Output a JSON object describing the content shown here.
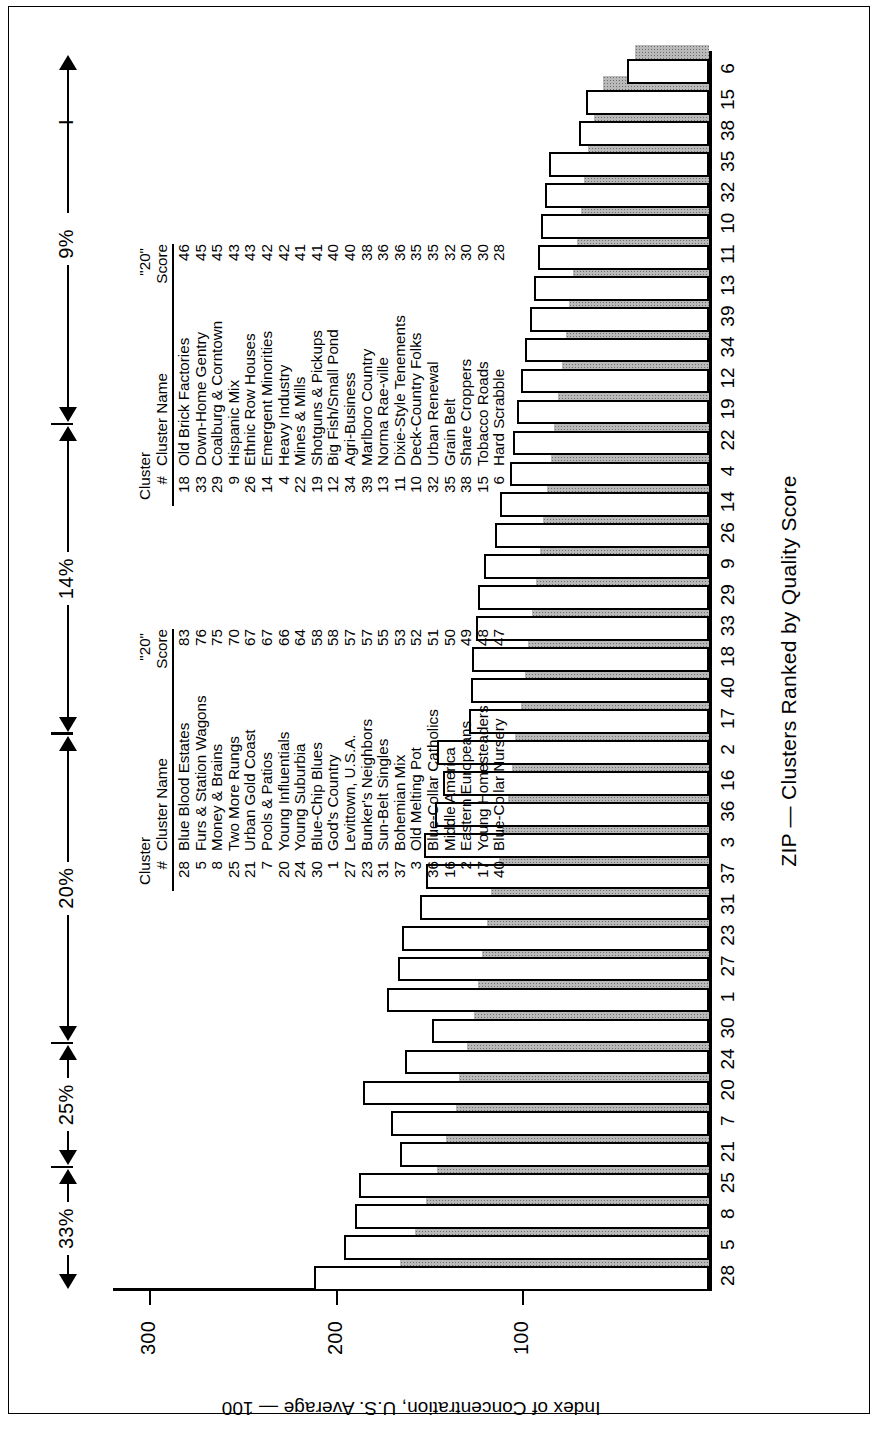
{
  "chart_data": {
    "type": "bar",
    "title": "ZIP — Clusters Ranked by Quality Score",
    "xlabel": "ZIP — Clusters Ranked by Quality Score",
    "ylabel": "Index of Concentration, U.S. Average — 100",
    "ylim": [
      0,
      320
    ],
    "yticks": [
      100,
      200,
      300
    ],
    "grid": false,
    "legend": null,
    "categories": [
      "28",
      "5",
      "8",
      "25",
      "21",
      "7",
      "20",
      "24",
      "30",
      "1",
      "27",
      "23",
      "31",
      "37",
      "3",
      "36",
      "16",
      "2",
      "17",
      "40",
      "18",
      "33",
      "29",
      "9",
      "26",
      "14",
      "4",
      "22",
      "19",
      "12",
      "34",
      "39",
      "13",
      "11",
      "10",
      "32",
      "35",
      "38",
      "15",
      "6"
    ],
    "series": [
      {
        "name": "outline-bar",
        "values": [
          212,
          196,
          190,
          188,
          166,
          171,
          186,
          163,
          149,
          173,
          167,
          165,
          155,
          152,
          153,
          147,
          143,
          146,
          129,
          128,
          127,
          125,
          124,
          121,
          115,
          112,
          107,
          105,
          103,
          101,
          99,
          96,
          94,
          92,
          90,
          88,
          86,
          70,
          66,
          44
        ]
      },
      {
        "name": "shaded-bar",
        "values": [
          166,
          158,
          152,
          146,
          141,
          136,
          134,
          130,
          126,
          124,
          122,
          119,
          117,
          113,
          111,
          108,
          106,
          104,
          101,
          99,
          97,
          95,
          93,
          91,
          89,
          87,
          85,
          83,
          81,
          79,
          77,
          75,
          73,
          71,
          69,
          67,
          65,
          62,
          57,
          40
        ]
      }
    ]
  },
  "y_axis": {
    "label": "Index of Concentration, U.S. Average — 100",
    "ticks": [
      "300",
      "200",
      "100"
    ]
  },
  "x_axis": {
    "title": "ZIP — Clusters Ranked by Quality Score",
    "ticks": [
      "28",
      "5",
      "8",
      "25",
      "21",
      "7",
      "20",
      "24",
      "30",
      "1",
      "27",
      "23",
      "31",
      "37",
      "3",
      "36",
      "16",
      "2",
      "17",
      "40",
      "18",
      "33",
      "29",
      "9",
      "26",
      "14",
      "4",
      "22",
      "19",
      "12",
      "34",
      "39",
      "13",
      "11",
      "10",
      "32",
      "35",
      "38",
      "15",
      "6"
    ]
  },
  "brackets": [
    {
      "label": "33%"
    },
    {
      "label": "25%"
    },
    {
      "label": "20%"
    },
    {
      "label": "14%"
    },
    {
      "label": "9%"
    }
  ],
  "table_left": {
    "group_header": "Cluster",
    "score_header_top": "\"20\"",
    "score_header_bottom": "Score",
    "columns": [
      "#",
      "Cluster Name",
      "Score"
    ],
    "rows": [
      {
        "num": "28",
        "name": "Blue Blood Estates",
        "score": "83"
      },
      {
        "num": "5",
        "name": "Furs & Station Wagons",
        "score": "76"
      },
      {
        "num": "8",
        "name": "Money & Brains",
        "score": "75"
      },
      {
        "num": "25",
        "name": "Two More Rungs",
        "score": "70"
      },
      {
        "num": "21",
        "name": "Urban Gold Coast",
        "score": "67"
      },
      {
        "num": "7",
        "name": "Pools & Patios",
        "score": "67"
      },
      {
        "num": "20",
        "name": "Young Influentials",
        "score": "66"
      },
      {
        "num": "24",
        "name": "Young Suburbia",
        "score": "64"
      },
      {
        "num": "30",
        "name": "Blue-Chip Blues",
        "score": "58"
      },
      {
        "num": "1",
        "name": "God's Country",
        "score": "58"
      },
      {
        "num": "27",
        "name": "Levittown, U.S.A.",
        "score": "57"
      },
      {
        "num": "23",
        "name": "Bunker's Neighbors",
        "score": "57"
      },
      {
        "num": "31",
        "name": "Sun-Belt Singles",
        "score": "55"
      },
      {
        "num": "37",
        "name": "Bohemian Mix",
        "score": "53"
      },
      {
        "num": "3",
        "name": "Old Melting Pot",
        "score": "52"
      },
      {
        "num": "36",
        "name": "Blue-Collar Catholics",
        "score": "51"
      },
      {
        "num": "16",
        "name": "Middle America",
        "score": "50"
      },
      {
        "num": "2",
        "name": "Eastern Europeans",
        "score": "49"
      },
      {
        "num": "17",
        "name": "Young Homesteaders",
        "score": "48"
      },
      {
        "num": "40",
        "name": "Blue-Collar Nursery",
        "score": "47"
      }
    ]
  },
  "table_right": {
    "group_header": "Cluster",
    "score_header_top": "\"20\"",
    "score_header_bottom": "Score",
    "columns": [
      "#",
      "Cluster Name",
      "Score"
    ],
    "rows": [
      {
        "num": "18",
        "name": "Old Brick Factories",
        "score": "46"
      },
      {
        "num": "33",
        "name": "Down-Home Gentry",
        "score": "45"
      },
      {
        "num": "29",
        "name": "Coalburg & Corntown",
        "score": "45"
      },
      {
        "num": "9",
        "name": "Hispanic Mix",
        "score": "43"
      },
      {
        "num": "26",
        "name": "Ethnic Row Houses",
        "score": "43"
      },
      {
        "num": "14",
        "name": "Emergent Minorities",
        "score": "42"
      },
      {
        "num": "4",
        "name": "Heavy Industry",
        "score": "42"
      },
      {
        "num": "22",
        "name": "Mines & Mills",
        "score": "41"
      },
      {
        "num": "19",
        "name": "Shotguns & Pickups",
        "score": "41"
      },
      {
        "num": "12",
        "name": "Big Fish/Small Pond",
        "score": "40"
      },
      {
        "num": "34",
        "name": "Agri-Business",
        "score": "40"
      },
      {
        "num": "39",
        "name": "Marlboro Country",
        "score": "38"
      },
      {
        "num": "13",
        "name": "Norma Rae-ville",
        "score": "36"
      },
      {
        "num": "11",
        "name": "Dixie-Style Tenements",
        "score": "36"
      },
      {
        "num": "10",
        "name": "Deck-Country Folks",
        "score": "35"
      },
      {
        "num": "32",
        "name": "Urban Renewal",
        "score": "35"
      },
      {
        "num": "35",
        "name": "Grain Belt",
        "score": "32"
      },
      {
        "num": "38",
        "name": "Share Croppers",
        "score": "30"
      },
      {
        "num": "15",
        "name": "Tobacco Roads",
        "score": "30"
      },
      {
        "num": "6",
        "name": "Hard Scrabble",
        "score": "28"
      }
    ]
  },
  "marks": {
    "dash": "I"
  }
}
